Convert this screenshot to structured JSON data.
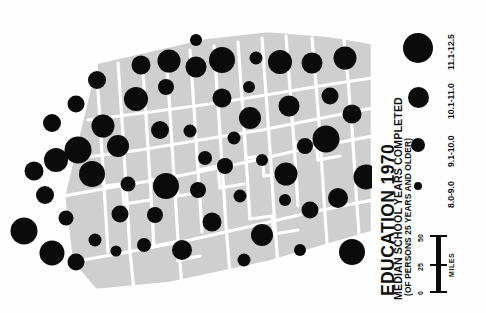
{
  "document": {
    "kind": "thematic-map",
    "orientation": "rotated-90-ccw"
  },
  "title": {
    "main": "EDUCATION 1970",
    "subtitle": "MEDIAN SCHOOL YEARS COMPLETED",
    "qualifier": "(OF PERSONS 25 YEARS AND OLDER)"
  },
  "legend": {
    "classes": [
      {
        "label": "8.0-9.0",
        "radius": 4.0,
        "min": 8.0,
        "max": 9.0
      },
      {
        "label": "9.1-10.0",
        "radius": 7.0,
        "min": 9.1,
        "max": 10.0
      },
      {
        "label": "10.1-11.0",
        "radius": 10.5,
        "min": 10.1,
        "max": 11.0
      },
      {
        "label": "11.1-12.5",
        "radius": 15.0,
        "min": 11.1,
        "max": 12.5
      }
    ]
  },
  "scalebar": {
    "unit": "MILES",
    "ticks": [
      "0",
      "25",
      "50"
    ]
  },
  "colors": {
    "symbol": "#0b0b0b",
    "land": "#cfcfcf",
    "boundary": "#ffffff",
    "background": "#ffffff",
    "text": "#111111"
  },
  "chart_data": {
    "type": "scatter",
    "xlabel": "",
    "ylabel": "",
    "symbol_encoding": "circle area proportional to median school years completed",
    "legend_classes": [
      "8.0-9.0",
      "9.1-10.0",
      "10.1-11.0",
      "11.1-12.5"
    ],
    "points": [
      {
        "x": 103,
        "y": 126,
        "r": 11.5,
        "class": "10.1-11.0"
      },
      {
        "x": 78,
        "y": 150,
        "r": 13.5,
        "class": "11.1-12.5"
      },
      {
        "x": 52,
        "y": 123,
        "r": 9.0,
        "class": "9.1-10.0"
      },
      {
        "x": 76,
        "y": 104,
        "r": 8.5,
        "class": "9.1-10.0"
      },
      {
        "x": 97,
        "y": 80,
        "r": 9.0,
        "class": "9.1-10.0"
      },
      {
        "x": 136,
        "y": 99,
        "r": 12.0,
        "class": "10.1-11.0"
      },
      {
        "x": 118,
        "y": 146,
        "r": 11.0,
        "class": "10.1-11.0"
      },
      {
        "x": 141,
        "y": 65,
        "r": 9.5,
        "class": "9.1-10.0"
      },
      {
        "x": 166,
        "y": 87,
        "r": 8.0,
        "class": "9.1-10.0"
      },
      {
        "x": 169,
        "y": 61,
        "r": 11.5,
        "class": "10.1-11.0"
      },
      {
        "x": 196,
        "y": 67,
        "r": 10.5,
        "class": "10.1-11.0"
      },
      {
        "x": 222,
        "y": 60,
        "r": 13.0,
        "class": "11.1-12.5"
      },
      {
        "x": 196,
        "y": 40,
        "r": 6.0,
        "class": "8.0-9.0"
      },
      {
        "x": 222,
        "y": 98,
        "r": 9.5,
        "class": "9.1-10.0"
      },
      {
        "x": 249,
        "y": 87,
        "r": 6.0,
        "class": "8.0-9.0"
      },
      {
        "x": 256,
        "y": 58,
        "r": 6.5,
        "class": "8.0-9.0"
      },
      {
        "x": 250,
        "y": 118,
        "r": 11.0,
        "class": "10.1-11.0"
      },
      {
        "x": 280,
        "y": 62,
        "r": 12.0,
        "class": "10.1-11.0"
      },
      {
        "x": 289,
        "y": 106,
        "r": 10.5,
        "class": "10.1-11.0"
      },
      {
        "x": 312,
        "y": 63,
        "r": 10.5,
        "class": "10.1-11.0"
      },
      {
        "x": 330,
        "y": 96,
        "r": 8.5,
        "class": "9.1-10.0"
      },
      {
        "x": 345,
        "y": 58,
        "r": 11.5,
        "class": "10.1-11.0"
      },
      {
        "x": 56,
        "y": 160,
        "r": 12.0,
        "class": "10.1-11.0"
      },
      {
        "x": 92,
        "y": 174,
        "r": 13.0,
        "class": "11.1-12.5"
      },
      {
        "x": 45,
        "y": 195,
        "r": 9.0,
        "class": "9.1-10.0"
      },
      {
        "x": 128,
        "y": 184,
        "r": 7.5,
        "class": "9.1-10.0"
      },
      {
        "x": 120,
        "y": 214,
        "r": 8.5,
        "class": "9.1-10.0"
      },
      {
        "x": 155,
        "y": 215,
        "r": 8.0,
        "class": "9.1-10.0"
      },
      {
        "x": 166,
        "y": 186,
        "r": 13.0,
        "class": "11.1-12.5"
      },
      {
        "x": 198,
        "y": 190,
        "r": 8.0,
        "class": "9.1-10.0"
      },
      {
        "x": 205,
        "y": 158,
        "r": 7.0,
        "class": "8.0-9.0"
      },
      {
        "x": 225,
        "y": 166,
        "r": 8.0,
        "class": "9.1-10.0"
      },
      {
        "x": 144,
        "y": 245,
        "r": 7.0,
        "class": "8.0-9.0"
      },
      {
        "x": 182,
        "y": 250,
        "r": 10.0,
        "class": "10.1-11.0"
      },
      {
        "x": 212,
        "y": 222,
        "r": 9.5,
        "class": "9.1-10.0"
      },
      {
        "x": 240,
        "y": 196,
        "r": 6.5,
        "class": "8.0-9.0"
      },
      {
        "x": 262,
        "y": 235,
        "r": 11.0,
        "class": "10.1-11.0"
      },
      {
        "x": 286,
        "y": 174,
        "r": 11.5,
        "class": "10.1-11.0"
      },
      {
        "x": 305,
        "y": 146,
        "r": 8.0,
        "class": "9.1-10.0"
      },
      {
        "x": 326,
        "y": 139,
        "r": 13.5,
        "class": "11.1-12.5"
      },
      {
        "x": 310,
        "y": 210,
        "r": 8.5,
        "class": "9.1-10.0"
      },
      {
        "x": 338,
        "y": 198,
        "r": 10.0,
        "class": "10.1-11.0"
      },
      {
        "x": 352,
        "y": 252,
        "r": 13.0,
        "class": "11.1-12.5"
      },
      {
        "x": 366,
        "y": 177,
        "r": 12.5,
        "class": "11.1-12.5"
      },
      {
        "x": 24,
        "y": 231,
        "r": 13.5,
        "class": "11.1-12.5"
      },
      {
        "x": 52,
        "y": 253,
        "r": 12.5,
        "class": "11.1-12.5"
      },
      {
        "x": 76,
        "y": 262,
        "r": 8.5,
        "class": "9.1-10.0"
      },
      {
        "x": 95,
        "y": 240,
        "r": 6.5,
        "class": "8.0-9.0"
      },
      {
        "x": 66,
        "y": 218,
        "r": 7.5,
        "class": "9.1-10.0"
      },
      {
        "x": 34,
        "y": 171,
        "r": 9.5,
        "class": "9.1-10.0"
      },
      {
        "x": 234,
        "y": 138,
        "r": 6.5,
        "class": "8.0-9.0"
      },
      {
        "x": 262,
        "y": 160,
        "r": 6.0,
        "class": "8.0-9.0"
      },
      {
        "x": 190,
        "y": 131,
        "r": 6.5,
        "class": "8.0-9.0"
      },
      {
        "x": 160,
        "y": 130,
        "r": 9.0,
        "class": "9.1-10.0"
      },
      {
        "x": 116,
        "y": 251,
        "r": 5.5,
        "class": "8.0-9.0"
      },
      {
        "x": 285,
        "y": 200,
        "r": 6.0,
        "class": "8.0-9.0"
      },
      {
        "x": 352,
        "y": 114,
        "r": 9.5,
        "class": "9.1-10.0"
      },
      {
        "x": 300,
        "y": 250,
        "r": 6.0,
        "class": "8.0-9.0"
      },
      {
        "x": 244,
        "y": 260,
        "r": 6.5,
        "class": "8.0-9.0"
      }
    ]
  }
}
